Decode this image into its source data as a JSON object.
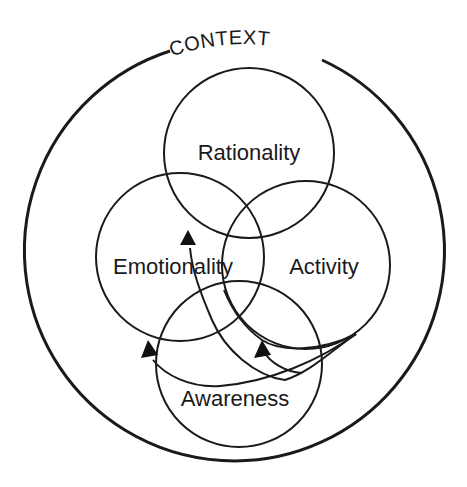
{
  "diagram": {
    "context": {
      "label": "CONTEXT",
      "circle": {
        "cx": 234,
        "cy": 251,
        "r": 210
      }
    },
    "circles": [
      {
        "id": "rationality",
        "label": "Rationality",
        "cx": 249,
        "cy": 153,
        "r": 85
      },
      {
        "id": "emotionality",
        "label": "Emotionality",
        "cx": 180,
        "cy": 257,
        "r": 84
      },
      {
        "id": "activity",
        "label": "Activity",
        "cx": 306,
        "cy": 265,
        "r": 84
      },
      {
        "id": "awareness",
        "label": "Awareness",
        "cx": 239,
        "cy": 364,
        "r": 83
      }
    ],
    "arrows": [
      {
        "id": "arrow-to-emotionality-top",
        "direction": "up",
        "target": "Emotionality"
      },
      {
        "id": "arrow-to-awareness-left",
        "direction": "up-left",
        "target": "Awareness"
      },
      {
        "id": "arrow-to-awareness-right",
        "direction": "up-left",
        "target": "Awareness"
      }
    ],
    "colors": {
      "stroke": "#1a1a1a",
      "background": "#ffffff"
    }
  }
}
